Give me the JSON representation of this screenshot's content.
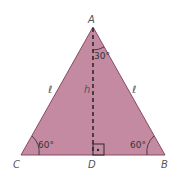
{
  "diagram": {
    "fill_color": "#c48aa2",
    "stroke_color": "#8a4a62",
    "vertices": {
      "A": {
        "label": "A"
      },
      "B": {
        "label": "B"
      },
      "C": {
        "label": "C"
      },
      "D": {
        "label": "D"
      }
    },
    "sides": {
      "left": "ℓ",
      "right": "ℓ",
      "height": "h"
    },
    "angles": {
      "apex_half": "30°",
      "left_base": "60°",
      "right_base": "60°"
    }
  }
}
